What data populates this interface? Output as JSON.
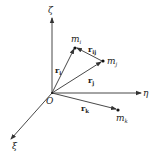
{
  "diagram": {
    "axes": {
      "zeta": {
        "label": "ζ"
      },
      "eta": {
        "label": "η"
      },
      "xi": {
        "label": "ξ"
      },
      "origin": {
        "label": "O"
      }
    },
    "points": {
      "mi": {
        "base": "m",
        "sub": "i"
      },
      "mj": {
        "base": "m",
        "sub": "j"
      },
      "mk": {
        "base": "m",
        "sub": "k"
      }
    },
    "vectors": {
      "ri": {
        "base": "r",
        "sub": "i"
      },
      "rj": {
        "base": "r",
        "sub": "j"
      },
      "rk": {
        "base": "r",
        "sub": "k"
      },
      "rij": {
        "base": "r",
        "sub": "ij"
      }
    },
    "colors": {
      "stroke": "#333333",
      "text": "#222222"
    }
  }
}
